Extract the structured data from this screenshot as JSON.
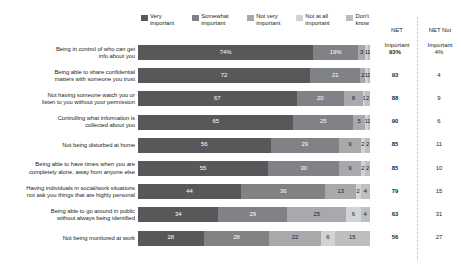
{
  "legend": {
    "items": [
      {
        "label_line1": "Very",
        "label_line2": "important",
        "color": "#58585b",
        "name": "very-important"
      },
      {
        "label_line1": "Somewhat",
        "label_line2": "important",
        "color": "#808285",
        "name": "somewhat-important"
      },
      {
        "label_line1": "Not very",
        "label_line2": "important",
        "color": "#a7a9ac",
        "name": "not-very-important"
      },
      {
        "label_line1": "Not at all",
        "label_line2": "important",
        "color": "#d1d3d4",
        "name": "not-at-all-important"
      },
      {
        "label_line1": "Don't",
        "label_line2": "know",
        "color": "#bcbec0",
        "name": "dont-know"
      }
    ]
  },
  "columns": {
    "net_important_line1": "NET",
    "net_important_line2": "Important",
    "net_not_important_line1": "NET Not",
    "net_not_important_line2": "Important"
  },
  "chart_data": {
    "type": "bar",
    "orientation": "horizontal",
    "stacked": true,
    "title": "",
    "xlabel": "",
    "ylabel": "",
    "xlim": [
      0,
      100
    ],
    "grid": false,
    "legend_position": "top",
    "series": [
      {
        "name": "Very important",
        "color": "#58585b",
        "values": [
          74,
          72,
          67,
          65,
          56,
          55,
          44,
          34,
          28
        ]
      },
      {
        "name": "Somewhat important",
        "color": "#808285",
        "values": [
          19,
          21,
          20,
          25,
          29,
          30,
          36,
          29,
          28
        ]
      },
      {
        "name": "Not very important",
        "color": "#a7a9ac",
        "values": [
          3,
          2,
          8,
          5,
          9,
          9,
          13,
          25,
          22
        ]
      },
      {
        "name": "Not at all important",
        "color": "#d1d3d4",
        "values": [
          1,
          1,
          1,
          1,
          2,
          2,
          2,
          6,
          6
        ]
      },
      {
        "name": "Don't know",
        "color": "#bcbec0",
        "values": [
          1,
          1,
          2,
          1,
          2,
          2,
          4,
          4,
          15
        ]
      }
    ],
    "categories": [
      "Being in control of who can get\ninfo about you",
      "Being able to share confidential\nmatters with someone you trust",
      "Not having someone watch you or\nlisten to you without your permission",
      "Controlling what information is\ncollected about you",
      "Not being disturbed at home",
      "Being able to have times when you are\ncompletely alone, away from anyone else",
      "Having individuals in social/work situations\nnot ask you things that are highly personal",
      "Being able to go around in public\nwithout always being identified",
      "Not being monitored at work"
    ],
    "data_labels": [
      [
        "74%",
        "19%",
        "3",
        "1",
        "1"
      ],
      [
        "72",
        "21",
        "2",
        "1",
        "1"
      ],
      [
        "67",
        "20",
        "8",
        "1",
        "2"
      ],
      [
        "65",
        "25",
        "5",
        "1",
        "1"
      ],
      [
        "56",
        "29",
        "9",
        "2",
        "2"
      ],
      [
        "55",
        "30",
        "9",
        "2",
        "2"
      ],
      [
        "44",
        "36",
        "13",
        "2",
        "4"
      ],
      [
        "34",
        "29",
        "25",
        "6",
        "4"
      ],
      [
        "28",
        "28",
        "22",
        "6",
        "15"
      ]
    ],
    "net_important": [
      "93%",
      "93",
      "88",
      "90",
      "85",
      "85",
      "79",
      "63",
      "56"
    ],
    "net_not_important": [
      "4%",
      "4",
      "9",
      "6",
      "11",
      "10",
      "15",
      "31",
      "27"
    ]
  }
}
